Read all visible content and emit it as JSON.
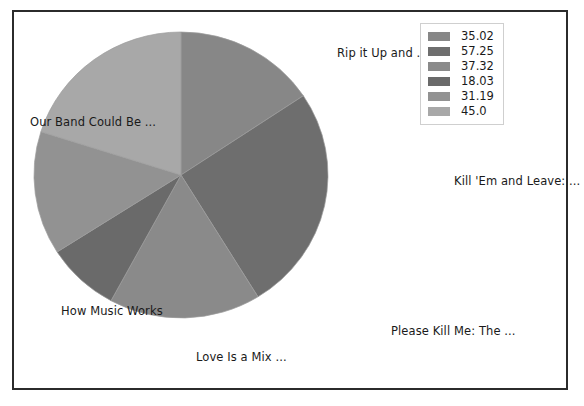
{
  "chart_data": {
    "type": "pie",
    "title": "",
    "categories": [
      "Rip it Up and ...",
      "Kill 'Em and Leave: ...",
      "Please Kill Me: The ...",
      "Love Is a Mix ...",
      "How Music Works",
      "Our Band Could Be ..."
    ],
    "values": [
      35.02,
      57.25,
      37.32,
      18.03,
      31.19,
      45.0
    ],
    "legend_labels": [
      "35.02",
      "57.25",
      "37.32",
      "18.03",
      "31.19",
      "45.0"
    ],
    "colors": [
      "#878787",
      "#6e6e6e",
      "#8a8a8a",
      "#6a6a6a",
      "#929292",
      "#a8a8a8"
    ],
    "legend_position": "top-right",
    "grid": false,
    "total": 223.81,
    "start_angle_deg": 90,
    "direction": "clockwise"
  },
  "labels": {
    "rip_it_up": "Rip it Up and ...",
    "kill_em_and_leave": "Kill 'Em and Leave: ...",
    "please_kill_me": "Please Kill Me: The ...",
    "love_is_a_mix": "Love Is a Mix ...",
    "how_music_works": "How Music Works",
    "our_band_could_be": "Our Band Could Be ..."
  },
  "legend": {
    "entries": [
      {
        "value": "35.02",
        "color": "#878787"
      },
      {
        "value": "57.25",
        "color": "#6e6e6e"
      },
      {
        "value": "37.32",
        "color": "#8a8a8a"
      },
      {
        "value": "18.03",
        "color": "#6a6a6a"
      },
      {
        "value": "31.19",
        "color": "#929292"
      },
      {
        "value": "45.0",
        "color": "#a8a8a8"
      }
    ]
  },
  "style": {
    "frame_color": "#2b2b2b",
    "background": "#ffffff",
    "text_color": "#1a1a1a",
    "legend_border": "#cfcfcf"
  }
}
